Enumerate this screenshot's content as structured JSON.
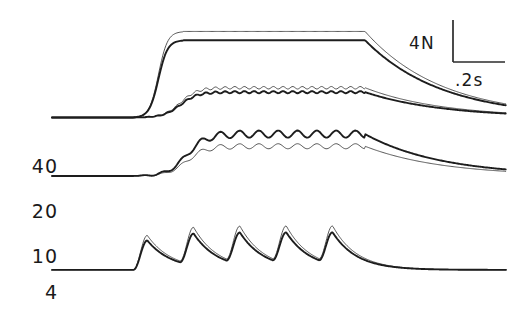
{
  "figure": {
    "background": "#ffffff",
    "ink_color": "#1d1d1d",
    "vertical_axis_title": "Force"
  },
  "scale_bar": {
    "force_label": "4N",
    "time_label": ".2s",
    "force_value": 4,
    "force_unit": "N",
    "time_value": 0.2,
    "time_unit": "s"
  },
  "frequency_labels": [
    {
      "text": "40",
      "unit": "Hz"
    },
    {
      "text": "20",
      "unit": "Hz"
    },
    {
      "text": "10",
      "unit": "Hz"
    },
    {
      "text": "4",
      "unit": "Hz"
    }
  ],
  "chart_data": {
    "type": "line",
    "title": "",
    "xlabel": "",
    "ylabel": "Force",
    "xlim": [
      0,
      1.45
    ],
    "ylim": [
      0,
      26
    ],
    "grid": false,
    "legend": "none",
    "axis_note": "Only a 4 N vertical and .2 s horizontal scale bar are drawn; no axis frame or tick marks.",
    "x_unit": "s",
    "y_unit": "N",
    "categories": [
      "40 Hz",
      "20 Hz",
      "10 Hz",
      "4 Hz"
    ],
    "series": [
      {
        "name": "10 Hz unpotentiated",
        "frequency_hz": 10,
        "style": "thin",
        "baseline_force": 16.8,
        "plateau_force": 24.6,
        "onset_time": 0.26,
        "offset_time": 1.0,
        "ripple_count": 0
      },
      {
        "name": "10 Hz potentiated",
        "frequency_hz": 10,
        "style": "thick",
        "baseline_force": 16.8,
        "plateau_force": 23.8,
        "onset_time": 0.26,
        "offset_time": 1.0,
        "ripple_count": 0
      },
      {
        "name": "20 Hz unpotentiated",
        "frequency_hz": 20,
        "style": "thin",
        "baseline_force": 16.8,
        "plateau_force": 19.5,
        "onset_time": 0.26,
        "offset_time": 1.0,
        "ripple_count": 24
      },
      {
        "name": "20 Hz potentiated",
        "frequency_hz": 20,
        "style": "thick",
        "baseline_force": 16.8,
        "plateau_force": 19.1,
        "onset_time": 0.26,
        "offset_time": 1.0,
        "ripple_count": 24
      },
      {
        "name": "40 Hz unpotentiated",
        "frequency_hz": 40,
        "style": "thin",
        "baseline_force": 11.5,
        "plateau_force": 14.2,
        "onset_time": 0.26,
        "offset_time": 1.0,
        "ripple_count": 12
      },
      {
        "name": "40 Hz potentiated",
        "frequency_hz": 40,
        "style": "thick",
        "baseline_force": 11.5,
        "plateau_force": 15.3,
        "onset_time": 0.26,
        "offset_time": 1.0,
        "ripple_count": 12
      },
      {
        "name": "4 Hz unpotentiated",
        "frequency_hz": 4,
        "style": "thin",
        "baseline_force": 3.0,
        "peak_force": 6.4,
        "onset_time": 0.26,
        "offset_time": 1.0,
        "twitch_count": 5
      },
      {
        "name": "4 Hz potentiated",
        "frequency_hz": 4,
        "style": "thick",
        "baseline_force": 3.0,
        "peak_force": 5.9,
        "onset_time": 0.26,
        "offset_time": 1.0,
        "twitch_count": 5
      }
    ]
  }
}
